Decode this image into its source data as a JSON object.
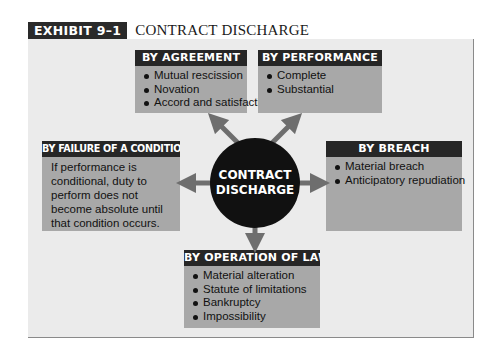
{
  "exhibit": {
    "label": "EXHIBIT 9–1",
    "title": "CONTRACT DISCHARGE"
  },
  "center": {
    "line1": "CONTRACT",
    "line2": "DISCHARGE"
  },
  "boxes": {
    "agreement": {
      "title": "BY AGREEMENT",
      "items": [
        "Mutual rescission",
        "Novation",
        "Accord and satisfaction"
      ]
    },
    "performance": {
      "title": "BY PERFORMANCE",
      "items": [
        "Complete",
        "Substantial"
      ]
    },
    "failure": {
      "title": "BY FAILURE OF A CONDITION",
      "text": "If performance is conditional, duty to perform does not become absolute until that condition occurs."
    },
    "breach": {
      "title": "BY BREACH",
      "items": [
        "Material breach",
        "Anticipatory repudiation"
      ]
    },
    "law": {
      "title": "BY OPERATION OF LAW",
      "items": [
        "Material alteration",
        "Statute of limitations",
        "Bankruptcy",
        "Impossibility"
      ]
    }
  },
  "colors": {
    "header_bar": "#262626",
    "box_fill": "#a8a8a8",
    "panel_fill": "#ebebeb",
    "hub_fill": "#111111",
    "arrow": "#6e6e6e"
  }
}
